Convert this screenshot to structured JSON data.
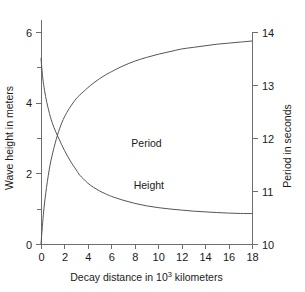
{
  "chart_data": {
    "type": "line",
    "title": "",
    "xlabel": "Decay distance in 10³ kilometers",
    "xlabel_main": "Decay distance in 10",
    "xlabel_sup": "3",
    "xlabel_tail": " kilometers",
    "ylabel_left": "Wave height in meters",
    "ylabel_right": "Period in seconds",
    "xlim": [
      0,
      18
    ],
    "xticks": [
      0,
      2,
      4,
      6,
      8,
      10,
      12,
      14,
      16,
      18
    ],
    "xticklabels": [
      "0",
      "2",
      "4",
      "6",
      "8",
      "10",
      "12",
      "14",
      "16",
      "18"
    ],
    "ylim_left": [
      0,
      6
    ],
    "yticks_left": [
      0,
      2,
      4,
      6
    ],
    "yticklabels_left": [
      "0",
      "2",
      "4",
      "6"
    ],
    "yminorticks_left": [
      1,
      3,
      5
    ],
    "ylim_right": [
      10,
      14
    ],
    "yticks_right": [
      10,
      11,
      12,
      13,
      14
    ],
    "yticklabels_right": [
      "10",
      "11",
      "12",
      "13",
      "14"
    ],
    "grid": false,
    "legend_position": "inline-curve-labels",
    "annotations": [
      {
        "text": "Period",
        "x": 9.0,
        "y_left_axis": 2.75
      },
      {
        "text": "Height",
        "x": 9.2,
        "y_left_axis": 1.55
      }
    ],
    "series": [
      {
        "name": "Height",
        "label": "Height",
        "axis": "left",
        "units": "meters",
        "color": "#555555",
        "x": [
          0,
          0.15,
          0.3,
          0.5,
          0.8,
          1.1,
          1.5,
          2.0,
          2.5,
          3.0,
          3.3,
          3.6,
          4.0,
          4.5,
          5.0,
          5.5,
          6.0,
          7.0,
          8.0,
          9.0,
          10.0,
          11.0,
          12.0,
          13.0,
          14.0,
          15.0,
          16.0,
          17.0,
          18.0
        ],
        "values": [
          5.25,
          4.7,
          4.35,
          4.0,
          3.6,
          3.3,
          3.0,
          2.65,
          2.35,
          2.1,
          1.95,
          1.85,
          1.72,
          1.6,
          1.5,
          1.42,
          1.35,
          1.24,
          1.15,
          1.08,
          1.03,
          0.99,
          0.96,
          0.93,
          0.91,
          0.89,
          0.875,
          0.865,
          0.86
        ]
      },
      {
        "name": "Period",
        "label": "Period",
        "axis": "right",
        "units": "seconds",
        "color": "#555555",
        "x": [
          0,
          0.2,
          0.4,
          0.7,
          1.0,
          1.4,
          1.8,
          2.2,
          2.6,
          3.0,
          3.3,
          3.6,
          4.0,
          4.5,
          5.0,
          5.5,
          6.0,
          7.0,
          8.0,
          9.0,
          10.0,
          11.0,
          12.0,
          13.0,
          14.0,
          15.0,
          16.0,
          17.0,
          18.0
        ],
        "values": [
          10.0,
          10.55,
          10.95,
          11.4,
          11.72,
          12.05,
          12.3,
          12.48,
          12.62,
          12.74,
          12.81,
          12.87,
          12.95,
          13.04,
          13.12,
          13.19,
          13.25,
          13.36,
          13.45,
          13.52,
          13.58,
          13.63,
          13.68,
          13.71,
          13.74,
          13.77,
          13.79,
          13.81,
          13.83
        ]
      }
    ]
  },
  "colors": {
    "background": "#ffffff",
    "axis": "#6e6e6e",
    "curve": "#555555",
    "text": "#1a1a1a"
  }
}
